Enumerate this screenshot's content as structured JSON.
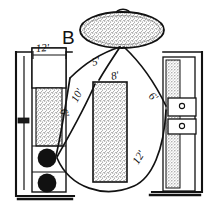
{
  "diagram": {
    "zone_label": "B",
    "title_letter": "B",
    "ink_color": "#121212",
    "paper_color": "#ffffff",
    "stipple_color": "#8c8c8c",
    "fill_black": "#111111",
    "dimension_labels": [
      {
        "id": "top-left-width",
        "text": "12'"
      },
      {
        "id": "sink-to-range",
        "text": "5'"
      },
      {
        "id": "sink-to-island",
        "text": "8'"
      },
      {
        "id": "sink-to-refrigerator",
        "text": "6'"
      },
      {
        "id": "range-to-counter",
        "text": "6'"
      },
      {
        "id": "range-to-island",
        "text": "10'"
      },
      {
        "id": "range-to-refrigerator",
        "text": "12'"
      }
    ],
    "fixtures": [
      {
        "id": "sink-oval",
        "name": "oval-sink"
      },
      {
        "id": "left-cabinet",
        "name": "left-counter-run"
      },
      {
        "id": "range-burners",
        "name": "cooktop-burners",
        "count": 2
      },
      {
        "id": "center-island",
        "name": "center-island"
      },
      {
        "id": "right-cabinet",
        "name": "right-counter-run"
      },
      {
        "id": "right-drawers",
        "name": "drawer-stack",
        "count": 2
      }
    ]
  }
}
